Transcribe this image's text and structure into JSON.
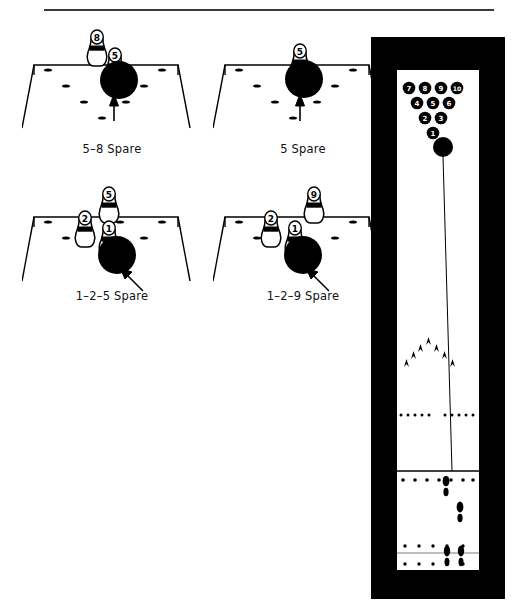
{
  "page": {
    "width": 517,
    "height": 616,
    "background_color": "#ffffff",
    "ink_color": "#000000",
    "rule_color": "#3a3a3a"
  },
  "spare_diagrams": [
    {
      "id": "spare-5-8",
      "caption": "5–8 Spare",
      "standing_pins": [
        "8",
        "5"
      ],
      "ball_target_pin": "5",
      "arrow": "vertical-up",
      "position": {
        "left": 22,
        "top": 28,
        "width": 180,
        "height": 110
      },
      "caption_top": 142
    },
    {
      "id": "spare-5",
      "caption": "5 Spare",
      "standing_pins": [
        "5"
      ],
      "ball_target_pin": "5",
      "arrow": "vertical-up",
      "position": {
        "left": 213,
        "top": 28,
        "width": 180,
        "height": 110
      },
      "caption_top": 142
    },
    {
      "id": "spare-1-2-5",
      "caption": "1–2–5 Spare",
      "standing_pins": [
        "5",
        "2",
        "1"
      ],
      "ball_target_pin": "1",
      "arrow": "diagonal-up-left",
      "position": {
        "left": 22,
        "top": 175,
        "width": 180,
        "height": 115
      },
      "caption_top": 289
    },
    {
      "id": "spare-1-2-9",
      "caption": "1–2–9 Spare",
      "standing_pins": [
        "9",
        "2",
        "1"
      ],
      "ball_target_pin": "1",
      "arrow": "diagonal-up-left",
      "position": {
        "left": 213,
        "top": 175,
        "width": 180,
        "height": 115
      },
      "caption_top": 289
    }
  ],
  "lane_diagram": {
    "id": "full-lane-view",
    "frame_color": "#000000",
    "surface_color": "#ffffff",
    "pin_rows": [
      {
        "row": 4,
        "pins": [
          "7",
          "8",
          "9",
          "10"
        ]
      },
      {
        "row": 3,
        "pins": [
          "4",
          "5",
          "6"
        ]
      },
      {
        "row": 2,
        "pins": [
          "2",
          "3"
        ]
      },
      {
        "row": 1,
        "pins": [
          "1"
        ]
      }
    ],
    "ball": {
      "label": "",
      "description": "bowling-ball-at-pocket"
    },
    "ball_path": {
      "description": "ball-track-line-from-approach-to-pocket"
    },
    "range_finder_arrows": {
      "count": 7,
      "description": "targeting-arrows"
    },
    "dot_rows": [
      {
        "name": "lane-dots",
        "left_group": 5,
        "right_group": 5
      },
      {
        "name": "foul-line-dots",
        "count": 7
      },
      {
        "name": "approach-dots-rear",
        "count": 5
      },
      {
        "name": "approach-dots-front",
        "count": 5
      }
    ],
    "foul_line": {
      "description": "foul-line"
    },
    "approach_line": {
      "description": "approach-reference-line"
    },
    "footprints": [
      {
        "name": "footprint-step-1"
      },
      {
        "name": "footprint-step-2"
      },
      {
        "name": "footprint-step-3"
      },
      {
        "name": "footprint-step-4"
      }
    ]
  }
}
